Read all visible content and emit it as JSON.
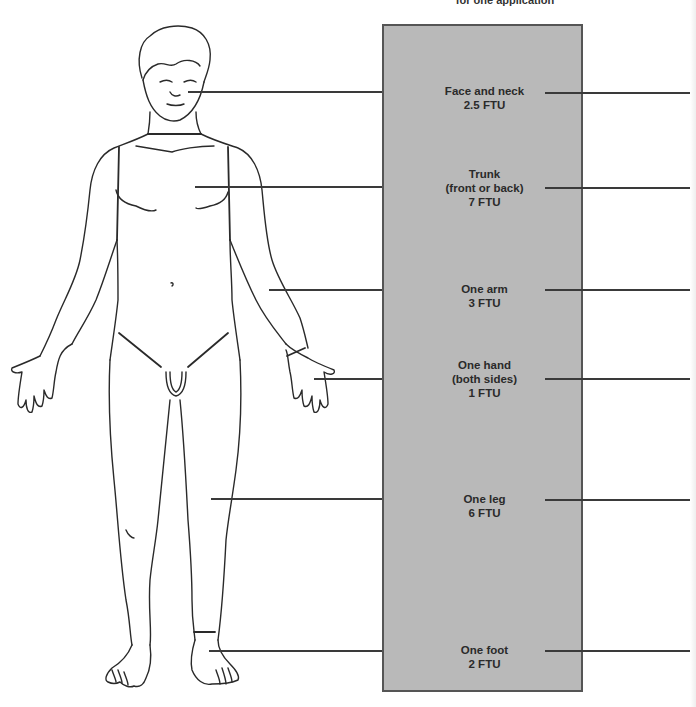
{
  "header": {
    "title_fragment": "for one application"
  },
  "panel": {
    "color": "#b9b9b9",
    "border_color": "#555555"
  },
  "regions": [
    {
      "name": "Face and neck",
      "dose": "2.5 FTU",
      "lines": [
        "Face and neck",
        "2.5 FTU"
      ],
      "y": 91
    },
    {
      "name": "Trunk (front or back)",
      "dose": "7 FTU",
      "lines": [
        "Trunk",
        "(front or back)",
        "7 FTU"
      ],
      "y": 187
    },
    {
      "name": "One arm",
      "dose": "3 FTU",
      "lines": [
        "One arm",
        "3 FTU"
      ],
      "y": 289
    },
    {
      "name": "One hand (both sides)",
      "dose": "1 FTU",
      "lines": [
        "One hand",
        "(both sides)",
        "1 FTU"
      ],
      "y": 378
    },
    {
      "name": "One leg",
      "dose": "6 FTU",
      "lines": [
        "One leg",
        "6 FTU"
      ],
      "y": 499
    },
    {
      "name": "One foot",
      "dose": "2 FTU",
      "lines": [
        "One foot",
        "2 FTU"
      ],
      "y": 651
    }
  ]
}
